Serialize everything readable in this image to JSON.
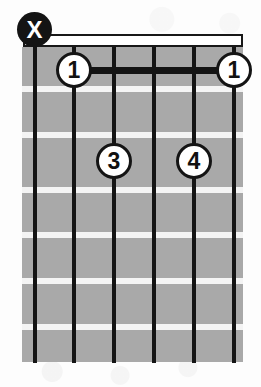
{
  "diagram": {
    "type": "guitar-chord-diagram",
    "width": 261,
    "height": 387,
    "string_count": 6,
    "fret_count": 7,
    "colors": {
      "background": "#fdfdfd",
      "fretboard": "#a9a9a9",
      "nut": "#ffffff",
      "string": "#141414",
      "fret_line": "#f4f4f4",
      "dot_fill": "#ffffff",
      "dot_border": "#141414",
      "mute_fill": "#141414",
      "mute_glyph": "#ffffff"
    }
  },
  "nut": {
    "label": "nut",
    "x": 23,
    "y": 34,
    "width": 220,
    "height": 13
  },
  "strings": [
    {
      "index": 1,
      "x": 35
    },
    {
      "index": 2,
      "x": 74
    },
    {
      "index": 3,
      "x": 114
    },
    {
      "index": 4,
      "x": 154
    },
    {
      "index": 5,
      "x": 194
    },
    {
      "index": 6,
      "x": 234
    }
  ],
  "fret_lines": [
    {
      "index": 1,
      "y": 86
    },
    {
      "index": 2,
      "y": 132
    },
    {
      "index": 3,
      "y": 187
    },
    {
      "index": 4,
      "y": 232
    },
    {
      "index": 5,
      "y": 278
    },
    {
      "index": 6,
      "y": 324
    }
  ],
  "barre": {
    "label": "barre",
    "fret": 1,
    "from_string": 2,
    "to_string": 6,
    "x": 74,
    "y": 67,
    "width": 160
  },
  "markers": [
    {
      "id": "mute-string-1",
      "kind": "mute",
      "glyph": "X",
      "string": 1,
      "fret": 0,
      "x": 35,
      "y": 30
    },
    {
      "id": "finger-1-string-2",
      "kind": "finger",
      "glyph": "1",
      "string": 2,
      "fret": 1,
      "x": 74,
      "y": 70
    },
    {
      "id": "finger-1-string-6",
      "kind": "finger",
      "glyph": "1",
      "string": 6,
      "fret": 1,
      "x": 234,
      "y": 70
    },
    {
      "id": "finger-3-string-3",
      "kind": "finger",
      "glyph": "3",
      "string": 3,
      "fret": 2,
      "x": 114,
      "y": 161
    },
    {
      "id": "finger-4-string-5",
      "kind": "finger",
      "glyph": "4",
      "string": 5,
      "fret": 2,
      "x": 194,
      "y": 161
    }
  ]
}
